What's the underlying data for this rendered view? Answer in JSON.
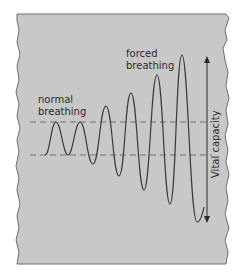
{
  "diagram": {
    "type": "spirogram",
    "labels": {
      "normal_line1": "normal",
      "normal_line2": "breathing",
      "forced_line1": "forced",
      "forced_line2": "breathing",
      "vital_capacity": "Vital capacity"
    },
    "colors": {
      "panel": "#c8c8c8",
      "border": "#6e6e6e",
      "curve": "#3a3a3a",
      "dashed": "#6a6a6a",
      "text": "#2a2a2a"
    },
    "reference_lines": {
      "upper_y": 122,
      "lower_y": 155
    },
    "curve_points": [
      [
        45,
        155
      ],
      [
        56,
        122
      ],
      [
        68,
        155
      ],
      [
        80,
        122
      ],
      [
        93,
        164
      ],
      [
        106,
        106
      ],
      [
        119,
        176
      ],
      [
        131,
        93
      ],
      [
        144,
        190
      ],
      [
        157,
        75
      ],
      [
        170,
        204
      ],
      [
        182,
        55
      ],
      [
        197,
        222
      ],
      [
        204,
        207
      ]
    ]
  }
}
